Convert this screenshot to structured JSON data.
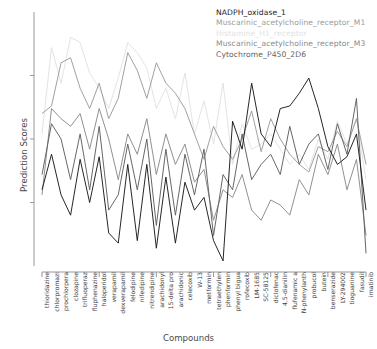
{
  "axes": {
    "ylabel": "Prediction Scores",
    "xlabel": "Compounds",
    "ylim": [
      0,
      1
    ],
    "grid": false,
    "y_ticks_labeled": false
  },
  "legend": {
    "position": "top-right",
    "items": [
      {
        "label": "NADPH_oxidase_1",
        "color": "#1a1a1a"
      },
      {
        "label": "Muscarinic_acetylcholine_receptor_M1",
        "color": "#9b9b9b"
      },
      {
        "label": "Histamine_H1_receptor",
        "color": "#e2e2e2"
      },
      {
        "label": "Muscarinic_acetylcholine_receptor_M3",
        "color": "#8a8a8a"
      },
      {
        "label": "Cytochrome_P450_2D6",
        "color": "#5f5f5f"
      }
    ]
  },
  "chart_data": {
    "type": "line",
    "title": "",
    "xlabel": "Compounds",
    "ylabel": "Prediction Scores",
    "ylim": [
      0,
      1
    ],
    "grid": false,
    "legend_position": "top-right",
    "categories": [
      "thioridazine",
      "chlorpromazi",
      "prochlorpera",
      "clozapine",
      "trifluoperaz",
      "fluphenazine",
      "haloperidol",
      "verapamil",
      "dexverapamil",
      "felodipine",
      "nifedipine",
      "nitrendipine",
      "arachidonyl",
      "15-delta pro",
      "arachidonic",
      "celecoxib",
      "W-13",
      "metformin",
      "tetraethylen",
      "phenformin",
      "phenyl bigua",
      "rofecoxib",
      "LM-1685",
      "SC-58125",
      "diclofenac",
      "4,5-dianilin",
      "flufenamic a",
      "N-phenylanth",
      "probucol",
      "butein",
      "benserazide",
      "LY-294002",
      "tioguanine",
      "fasudil",
      "imatinib"
    ],
    "series": [
      {
        "name": "NADPH_oxidase_1",
        "color": "#1a1a1a",
        "values": [
          0.3,
          0.44,
          0.28,
          0.2,
          0.42,
          0.25,
          0.43,
          0.13,
          0.09,
          0.4,
          0.1,
          0.4,
          0.07,
          0.35,
          0.09,
          0.33,
          0.22,
          0.27,
          0.1,
          0.02,
          0.57,
          0.46,
          0.72,
          0.52,
          0.47,
          0.62,
          0.63,
          0.68,
          0.74,
          0.62,
          0.47,
          0.4,
          0.43,
          0.52,
          0.22
        ]
      },
      {
        "name": "Muscarinic_acetylcholine_receptor_M1",
        "color": "#9b9b9b",
        "values": [
          0.6,
          0.63,
          0.8,
          0.82,
          0.7,
          0.62,
          0.72,
          0.58,
          0.66,
          0.84,
          0.77,
          0.66,
          0.8,
          0.72,
          0.68,
          0.62,
          0.52,
          0.42,
          0.55,
          0.47,
          0.42,
          0.5,
          0.61,
          0.45,
          0.58,
          0.5,
          0.44,
          0.4,
          0.37,
          0.47,
          0.45,
          0.53,
          0.47,
          0.58,
          0.4
        ]
      },
      {
        "name": "Histamine_H1_receptor",
        "color": "#e2e2e2",
        "values": [
          0.52,
          0.86,
          0.72,
          0.9,
          0.88,
          0.76,
          0.7,
          0.62,
          0.74,
          0.88,
          0.84,
          0.78,
          0.62,
          0.7,
          0.58,
          0.76,
          0.52,
          0.65,
          0.48,
          0.72,
          0.4,
          0.56,
          0.46,
          0.48,
          0.52,
          0.46,
          0.4,
          0.44,
          0.38,
          0.5,
          0.42,
          0.57,
          0.48,
          0.58,
          0.34
        ]
      },
      {
        "name": "Muscarinic_acetylcholine_receptor_M3",
        "color": "#8a8a8a",
        "values": [
          0.28,
          0.62,
          0.58,
          0.55,
          0.6,
          0.46,
          0.62,
          0.5,
          0.34,
          0.52,
          0.44,
          0.58,
          0.36,
          0.52,
          0.4,
          0.48,
          0.33,
          0.38,
          0.18,
          0.3,
          0.27,
          0.36,
          0.22,
          0.18,
          0.26,
          0.24,
          0.2,
          0.34,
          0.28,
          0.44,
          0.36,
          0.48,
          0.3,
          0.42,
          0.12
        ]
      },
      {
        "name": "Cytochrome_P450_2D6",
        "color": "#5f5f5f",
        "values": [
          0.36,
          0.56,
          0.5,
          0.34,
          0.52,
          0.3,
          0.55,
          0.22,
          0.28,
          0.48,
          0.3,
          0.5,
          0.16,
          0.46,
          0.2,
          0.44,
          0.28,
          0.46,
          0.12,
          0.36,
          0.3,
          0.52,
          0.34,
          0.4,
          0.44,
          0.36,
          0.55,
          0.4,
          0.48,
          0.52,
          0.38,
          0.56,
          0.44,
          0.66,
          0.05
        ]
      }
    ]
  }
}
